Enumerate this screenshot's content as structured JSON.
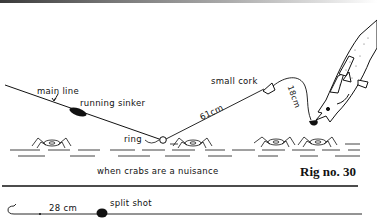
{
  "figure": {
    "rig_label": "Rig no. 30",
    "caption": "when crabs are a nuisance"
  },
  "labels": {
    "main_line": "main line",
    "running_sinker": "running sinker",
    "ring": "ring",
    "small_cork": "small cork",
    "leader_length": "61cm",
    "dropper_length": "18cm"
  },
  "detail": {
    "length": "28 cm",
    "split_shot": "split shot"
  },
  "colors": {
    "ink": "#111111",
    "paper": "#ffffff"
  }
}
